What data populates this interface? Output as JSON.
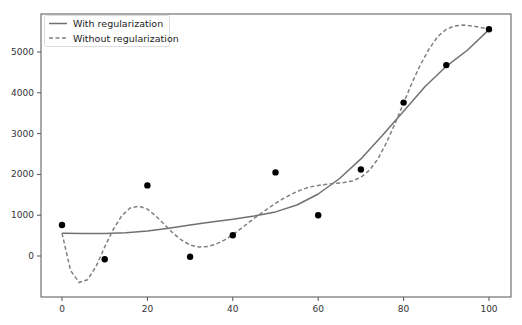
{
  "chart_data": {
    "type": "line",
    "title": "",
    "xlabel": "",
    "ylabel": "",
    "xlim": [
      -5,
      105
    ],
    "ylim": [
      -1000,
      5800
    ],
    "grid": false,
    "legend_position": "upper left",
    "x_ticks": [
      0,
      20,
      40,
      60,
      80,
      100
    ],
    "y_ticks": [
      0,
      1000,
      2000,
      3000,
      4000,
      5000
    ],
    "x_tick_labels": [
      "0",
      "20",
      "40",
      "60",
      "80",
      "100"
    ],
    "y_tick_labels": [
      "0",
      "1000",
      "2000",
      "3000",
      "4000",
      "5000"
    ],
    "legend": [
      "With regularization",
      "Without regularization"
    ],
    "scatter": {
      "name": "data points",
      "x": [
        0,
        10,
        20,
        30,
        40,
        50,
        60,
        70,
        80,
        90,
        100
      ],
      "y": [
        760,
        -80,
        1730,
        -20,
        510,
        2050,
        1000,
        2120,
        3760,
        4680,
        5560
      ],
      "color": "#000000"
    },
    "series": [
      {
        "name": "With regularization",
        "style": "solid",
        "color": "#707070",
        "x": [
          0,
          5,
          10,
          15,
          20,
          25,
          30,
          35,
          40,
          45,
          50,
          55,
          60,
          65,
          70,
          75,
          80,
          85,
          90,
          95,
          100
        ],
        "values": [
          560,
          550,
          550,
          570,
          610,
          680,
          760,
          830,
          900,
          980,
          1080,
          1250,
          1520,
          1900,
          2380,
          2950,
          3550,
          4150,
          4650,
          5050,
          5550
        ]
      },
      {
        "name": "Without regularization",
        "style": "dashed",
        "color": "#808080",
        "x": [
          0,
          2,
          4,
          6,
          8,
          10,
          12,
          14,
          16,
          18,
          20,
          22,
          24,
          26,
          28,
          30,
          32,
          34,
          36,
          38,
          40,
          42,
          44,
          46,
          48,
          50,
          52,
          54,
          56,
          58,
          60,
          62,
          64,
          66,
          68,
          70,
          72,
          74,
          76,
          78,
          80,
          82,
          84,
          86,
          88,
          90,
          92,
          94,
          96,
          98,
          100
        ],
        "values": [
          560,
          -350,
          -650,
          -580,
          -250,
          220,
          650,
          990,
          1180,
          1220,
          1150,
          980,
          770,
          560,
          390,
          270,
          220,
          230,
          290,
          390,
          520,
          680,
          840,
          1000,
          1150,
          1290,
          1420,
          1530,
          1620,
          1690,
          1730,
          1760,
          1780,
          1800,
          1840,
          1930,
          2100,
          2380,
          2780,
          3250,
          3750,
          4250,
          4700,
          5080,
          5380,
          5560,
          5640,
          5660,
          5640,
          5600,
          5560
        ]
      }
    ]
  }
}
